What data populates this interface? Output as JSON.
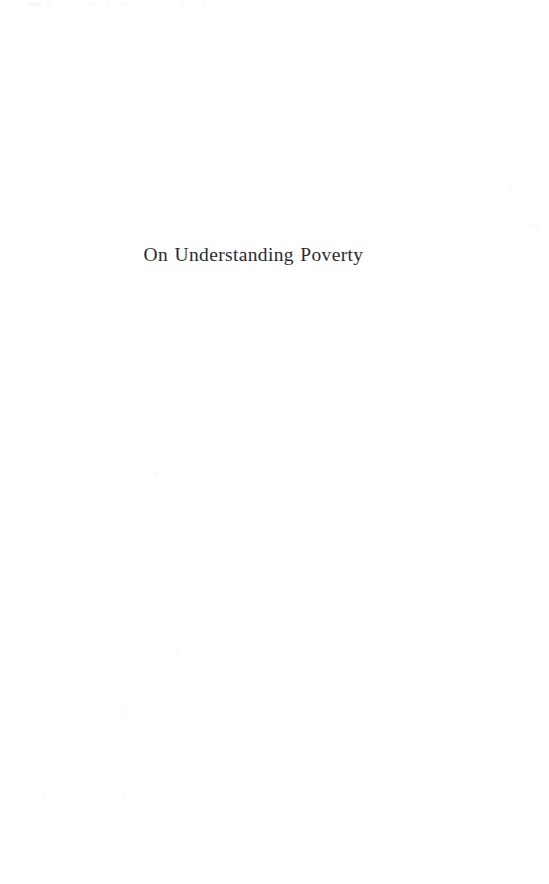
{
  "page": {
    "kind": "scanned-book-half-title-page",
    "width": 549,
    "height": 884,
    "background_color": "#ffffff",
    "ink_color": "#2b2b2d",
    "speck_color": "#f4f4f6"
  },
  "halftitle": {
    "text": "On Understanding Poverty"
  },
  "artifacts": {
    "label": "scan-specks"
  }
}
